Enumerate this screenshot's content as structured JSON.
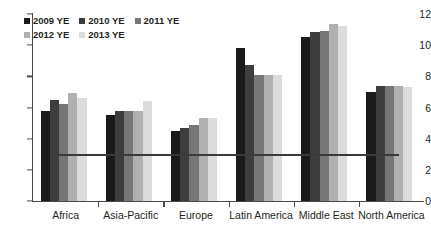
{
  "chart_data": {
    "type": "bar",
    "title": "",
    "subtitle": "",
    "xlabel": "",
    "ylabel": "",
    "ylim": [
      0,
      12
    ],
    "yticks": [
      0,
      2,
      4,
      6,
      8,
      10,
      12
    ],
    "ytick_labels": [
      "0",
      "2",
      "4",
      "6",
      "8",
      "10",
      "12"
    ],
    "grid": false,
    "legend_position": "top-left",
    "categories": [
      "Africa",
      "Asia-Pacific",
      "Europe",
      "Latin America",
      "Middle East",
      "North America"
    ],
    "series": [
      {
        "name": "2009 YE",
        "color": "#1a1a1a",
        "values": [
          5.8,
          5.5,
          4.5,
          9.8,
          10.55,
          7.0
        ]
      },
      {
        "name": "2010 YE",
        "color": "#3d3d3d",
        "values": [
          6.5,
          5.8,
          4.7,
          8.75,
          10.85,
          7.35
        ]
      },
      {
        "name": "2011 YE",
        "color": "#767676",
        "values": [
          6.2,
          5.8,
          4.9,
          8.1,
          10.9,
          7.35
        ]
      },
      {
        "name": "2012 YE",
        "color": "#b0b0b0",
        "values": [
          6.9,
          5.8,
          5.3,
          8.1,
          11.35,
          7.35
        ]
      },
      {
        "name": "2013 YE",
        "color": "#dcdcdc",
        "values": [
          6.6,
          6.45,
          5.3,
          8.1,
          11.2,
          7.3
        ]
      }
    ],
    "annotations": [
      {
        "name": "reference-line",
        "type": "horizontal-line",
        "value": 3.0,
        "color": "#3a3a3a",
        "from_category": "Africa",
        "to_category": "North America"
      }
    ]
  },
  "axis": {
    "y_label_0": "0",
    "y_label_2": "2",
    "y_label_4": "4",
    "y_label_6": "6",
    "y_label_8": "8",
    "y_label_10": "10",
    "y_label_12": "12"
  }
}
